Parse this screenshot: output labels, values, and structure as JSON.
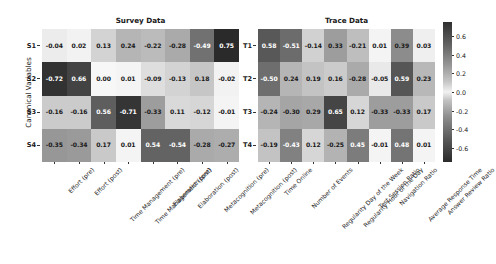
{
  "figure": {
    "ylabel": "Canonical Variables"
  },
  "panels": [
    {
      "key": "survey",
      "title": "Survey Data",
      "row_labels": [
        "S1",
        "S2",
        "S3",
        "S4"
      ],
      "col_labels": [
        "Effort (pre)",
        "Effort (post)",
        "Time Management (pre)",
        "Time Management (post)",
        "Elaboration (pre)",
        "Elaboration (post)",
        "Metacognition (pre)",
        "Metacognition (post)"
      ],
      "values": [
        [
          -0.04,
          0.02,
          0.13,
          0.24,
          -0.22,
          -0.28,
          -0.49,
          0.75
        ],
        [
          -0.72,
          0.66,
          0.0,
          0.01,
          -0.09,
          -0.13,
          0.18,
          -0.02
        ],
        [
          -0.16,
          -0.16,
          0.56,
          -0.71,
          -0.33,
          0.11,
          -0.12,
          -0.01
        ],
        [
          -0.35,
          -0.34,
          0.17,
          0.01,
          0.54,
          -0.54,
          -0.28,
          -0.27
        ]
      ]
    },
    {
      "key": "trace",
      "title": "Trace Data",
      "row_labels": [
        "T1",
        "T2",
        "T3",
        "T4"
      ],
      "col_labels": [
        "Time Online",
        "Number of Events",
        "Regularity Day of the Week",
        "Regularity Hour of the Day",
        "Test Session Ratio",
        "Navigation Ratio",
        "Average Response Time",
        "Answer Review Ratio"
      ],
      "values": [
        [
          0.58,
          -0.51,
          -0.14,
          0.33,
          -0.21,
          0.01,
          0.39,
          0.03
        ],
        [
          -0.5,
          0.24,
          0.19,
          0.16,
          -0.28,
          -0.05,
          0.59,
          0.23
        ],
        [
          -0.24,
          -0.3,
          0.29,
          0.65,
          0.12,
          -0.33,
          -0.33,
          0.17
        ],
        [
          -0.19,
          -0.43,
          0.12,
          -0.25,
          0.45,
          -0.01,
          0.48,
          0.01
        ]
      ]
    }
  ],
  "colorbar": {
    "ticks": [
      0.6,
      0.4,
      0.2,
      0.0,
      -0.2,
      -0.4,
      -0.6
    ],
    "tick_labels": [
      "0.6",
      "0.4",
      "0.2",
      "0.0",
      "-0.2",
      "-0.4",
      "-0.6"
    ],
    "vmin": -0.75,
    "vmax": 0.75
  },
  "chart_data": {
    "type": "heatmap",
    "title": "",
    "subplots": [
      "Survey Data",
      "Trace Data"
    ],
    "ylabel": "Canonical Variables",
    "xlabel": "",
    "colormap": "gray-diverging-symmetric",
    "cbar_range": [
      -0.75,
      0.75
    ],
    "cbar_ticks": [
      0.6,
      0.4,
      0.2,
      0.0,
      -0.2,
      -0.4,
      -0.6
    ],
    "panels": [
      {
        "name": "Survey Data",
        "rows": [
          "S1",
          "S2",
          "S3",
          "S4"
        ],
        "columns": [
          "Effort (pre)",
          "Effort (post)",
          "Time Management (pre)",
          "Time Management (post)",
          "Elaboration (pre)",
          "Elaboration (post)",
          "Metacognition (pre)",
          "Metacognition (post)"
        ],
        "matrix": [
          [
            -0.04,
            0.02,
            0.13,
            0.24,
            -0.22,
            -0.28,
            -0.49,
            0.75
          ],
          [
            -0.72,
            0.66,
            0.0,
            0.01,
            -0.09,
            -0.13,
            0.18,
            -0.02
          ],
          [
            -0.16,
            -0.16,
            0.56,
            -0.71,
            -0.33,
            0.11,
            -0.12,
            -0.01
          ],
          [
            -0.35,
            -0.34,
            0.17,
            0.01,
            0.54,
            -0.54,
            -0.28,
            -0.27
          ]
        ]
      },
      {
        "name": "Trace Data",
        "rows": [
          "T1",
          "T2",
          "T3",
          "T4"
        ],
        "columns": [
          "Time Online",
          "Number of Events",
          "Regularity Day of the Week",
          "Regularity Hour of the Day",
          "Test Session Ratio",
          "Navigation Ratio",
          "Average Response Time",
          "Answer Review Ratio"
        ],
        "matrix": [
          [
            0.58,
            -0.51,
            -0.14,
            0.33,
            -0.21,
            0.01,
            0.39,
            0.03
          ],
          [
            -0.5,
            0.24,
            0.19,
            0.16,
            -0.28,
            -0.05,
            0.59,
            0.23
          ],
          [
            -0.24,
            -0.3,
            0.29,
            0.65,
            0.12,
            -0.33,
            -0.33,
            0.17
          ],
          [
            -0.19,
            -0.43,
            0.12,
            -0.25,
            0.45,
            -0.01,
            0.48,
            0.01
          ]
        ]
      }
    ]
  }
}
